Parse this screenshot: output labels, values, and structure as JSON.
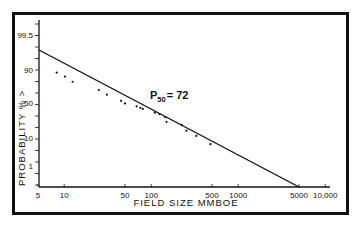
{
  "chart_data": {
    "type": "scatter",
    "title": "",
    "xlabel": "FIELD SIZE MMBOE",
    "ylabel": "PROBABILITY % >",
    "x_scale": "log",
    "y_scale": "probability",
    "x_tick_labels": [
      "5",
      "10",
      "50",
      "100",
      "500",
      "1000",
      "5000",
      "10,000"
    ],
    "x_tick_values": [
      5,
      10,
      50,
      100,
      500,
      1000,
      5000,
      10000
    ],
    "y_tick_labels": [
      "99.5",
      "90",
      "50",
      "10",
      "1"
    ],
    "y_tick_values": [
      99.5,
      90,
      50,
      10,
      1
    ],
    "xlim": [
      5,
      10000
    ],
    "grid": false,
    "legend": null,
    "annotations": [
      {
        "text_main": "P",
        "text_sub": "50",
        "text_rest": "= 72",
        "full_text": "P50 = 72"
      }
    ],
    "series": [
      {
        "name": "observed fields",
        "type": "scatter",
        "points": [
          {
            "x": 8.2,
            "y": 86
          },
          {
            "x": 10.2,
            "y": 80
          },
          {
            "x": 12.5,
            "y": 73
          },
          {
            "x": 25,
            "y": 63
          },
          {
            "x": 31,
            "y": 58
          },
          {
            "x": 45,
            "y": 52
          },
          {
            "x": 50,
            "y": 49
          },
          {
            "x": 68,
            "y": 43
          },
          {
            "x": 75,
            "y": 40
          },
          {
            "x": 80,
            "y": 38
          },
          {
            "x": 110,
            "y": 32
          },
          {
            "x": 125,
            "y": 30
          },
          {
            "x": 145,
            "y": 26
          },
          {
            "x": 150,
            "y": 21
          },
          {
            "x": 225,
            "y": 18
          },
          {
            "x": 255,
            "y": 14
          },
          {
            "x": 330,
            "y": 11
          },
          {
            "x": 480,
            "y": 6
          }
        ]
      },
      {
        "name": "fitted lognormal line",
        "type": "line",
        "points": [
          {
            "x": 5,
            "y": 96
          },
          {
            "x": 72,
            "y": 50
          },
          {
            "x": 5000,
            "y": 0.25
          }
        ]
      }
    ]
  }
}
